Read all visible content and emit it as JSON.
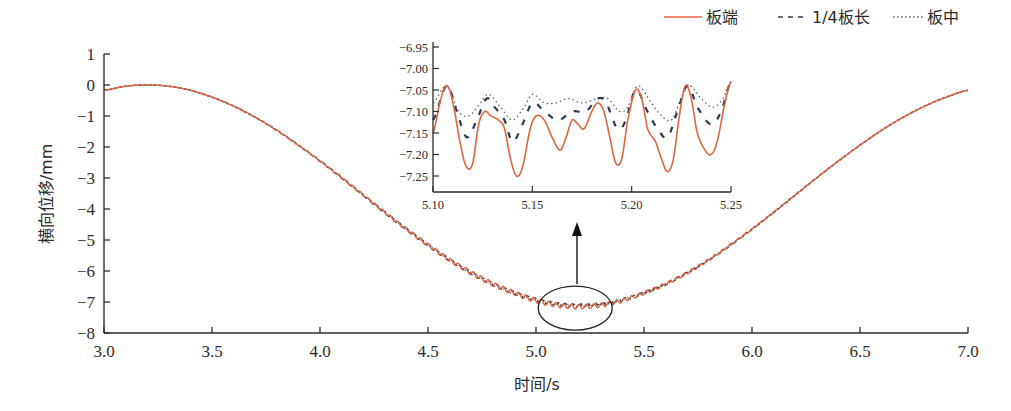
{
  "chart_data": {
    "type": "line",
    "title": "",
    "xlabel": "时间/s",
    "ylabel": "横向位移/mm",
    "xlim": [
      3.0,
      7.0
    ],
    "ylim": [
      -8,
      1
    ],
    "xticks": [
      "3.0",
      "3.5",
      "4.0",
      "4.5",
      "5.0",
      "5.5",
      "6.0",
      "6.5",
      "7.0"
    ],
    "yticks": [
      "1",
      "0",
      "−1",
      "−2",
      "−3",
      "−4",
      "−5",
      "−6",
      "−7",
      "−8"
    ],
    "grid": false,
    "legend_position": "top-right",
    "colors": {
      "板端": "#e0653f",
      "1/4板长": "#2b3a4f",
      "板中": "#5a6472",
      "axis": "#2a2a2a"
    },
    "x": [
      3.0,
      3.1,
      3.2,
      3.3,
      3.4,
      3.5,
      3.6,
      3.7,
      3.8,
      3.9,
      4.0,
      4.1,
      4.2,
      4.3,
      4.4,
      4.5,
      4.6,
      4.7,
      4.8,
      4.9,
      5.0,
      5.1,
      5.2,
      5.3,
      5.4,
      5.5,
      5.6,
      5.7,
      5.8,
      5.9,
      6.0,
      6.1,
      6.2,
      6.3,
      6.4,
      6.5,
      6.6,
      6.7,
      6.8,
      6.9,
      7.0
    ],
    "series": [
      {
        "name": "板端",
        "style": "solid",
        "values": [
          -0.17,
          -0.04,
          0.0,
          -0.04,
          -0.17,
          -0.39,
          -0.68,
          -1.04,
          -1.46,
          -1.94,
          -2.45,
          -2.99,
          -3.55,
          -4.11,
          -4.65,
          -5.16,
          -5.64,
          -6.06,
          -6.42,
          -6.71,
          -6.95,
          -7.1,
          -7.15,
          -7.1,
          -6.95,
          -6.71,
          -6.42,
          -6.06,
          -5.64,
          -5.16,
          -4.65,
          -4.11,
          -3.55,
          -2.99,
          -2.45,
          -1.94,
          -1.46,
          -1.04,
          -0.68,
          -0.39,
          -0.17
        ]
      },
      {
        "name": "1/4板长",
        "style": "dashed",
        "values": [
          -0.17,
          -0.04,
          0.0,
          -0.04,
          -0.17,
          -0.39,
          -0.68,
          -1.04,
          -1.46,
          -1.94,
          -2.45,
          -2.99,
          -3.55,
          -4.11,
          -4.65,
          -5.16,
          -5.64,
          -6.06,
          -6.42,
          -6.71,
          -6.93,
          -7.07,
          -7.11,
          -7.07,
          -6.93,
          -6.71,
          -6.42,
          -6.06,
          -5.64,
          -5.16,
          -4.65,
          -4.11,
          -3.55,
          -2.99,
          -2.45,
          -1.94,
          -1.46,
          -1.04,
          -0.68,
          -0.39,
          -0.17
        ]
      },
      {
        "name": "板中",
        "style": "dotted",
        "values": [
          -0.17,
          -0.04,
          0.0,
          -0.04,
          -0.17,
          -0.39,
          -0.68,
          -1.04,
          -1.46,
          -1.94,
          -2.45,
          -2.99,
          -3.55,
          -4.11,
          -4.65,
          -5.16,
          -5.64,
          -6.06,
          -6.42,
          -6.71,
          -6.92,
          -7.06,
          -7.09,
          -7.06,
          -6.92,
          -6.71,
          -6.42,
          -6.06,
          -5.64,
          -5.16,
          -4.65,
          -4.11,
          -3.55,
          -2.99,
          -2.45,
          -1.94,
          -1.46,
          -1.04,
          -0.68,
          -0.39,
          -0.17
        ]
      }
    ],
    "annotations": [
      {
        "type": "ellipse",
        "center": [
          5.2,
          -7.1
        ],
        "note": "zoom region"
      },
      {
        "type": "arrow",
        "from": "ellipse",
        "to": "inset"
      }
    ],
    "inset": {
      "type": "line",
      "xlim": [
        5.1,
        5.25
      ],
      "ylim": [
        -7.285,
        -6.95
      ],
      "xticks": [
        "5.10",
        "5.15",
        "5.20",
        "5.25"
      ],
      "yticks": [
        "−6.95",
        "−7.00",
        "−7.05",
        "−7.10",
        "−7.15",
        "−7.20",
        "−7.25"
      ],
      "series": [
        {
          "name": "板端",
          "style": "solid",
          "x": [
            5.1,
            5.104,
            5.107,
            5.11,
            5.114,
            5.117,
            5.12,
            5.123,
            5.126,
            5.129,
            5.133,
            5.136,
            5.139,
            5.142,
            5.145,
            5.149,
            5.152,
            5.156,
            5.16,
            5.164,
            5.167,
            5.17,
            5.173,
            5.176,
            5.18,
            5.183,
            5.186,
            5.189,
            5.192,
            5.195,
            5.198,
            5.202,
            5.205,
            5.208,
            5.212,
            5.215,
            5.218,
            5.221,
            5.224,
            5.227,
            5.23,
            5.233,
            5.237,
            5.24,
            5.243,
            5.247,
            5.25
          ],
          "values": [
            -7.15,
            -7.07,
            -7.04,
            -7.08,
            -7.18,
            -7.23,
            -7.22,
            -7.13,
            -7.1,
            -7.11,
            -7.12,
            -7.14,
            -7.21,
            -7.25,
            -7.23,
            -7.14,
            -7.11,
            -7.12,
            -7.16,
            -7.19,
            -7.16,
            -7.12,
            -7.13,
            -7.14,
            -7.1,
            -7.08,
            -7.1,
            -7.16,
            -7.22,
            -7.21,
            -7.12,
            -7.05,
            -7.07,
            -7.14,
            -7.17,
            -7.21,
            -7.24,
            -7.21,
            -7.11,
            -7.04,
            -7.07,
            -7.15,
            -7.19,
            -7.2,
            -7.17,
            -7.08,
            -7.03
          ]
        },
        {
          "name": "1/4板长",
          "style": "dashed",
          "x": [
            5.1,
            5.107,
            5.112,
            5.117,
            5.122,
            5.127,
            5.131,
            5.136,
            5.14,
            5.145,
            5.15,
            5.156,
            5.163,
            5.17,
            5.177,
            5.183,
            5.187,
            5.193,
            5.197,
            5.202,
            5.208,
            5.213,
            5.218,
            5.223,
            5.228,
            5.233,
            5.24,
            5.245,
            5.25
          ],
          "values": [
            -7.12,
            -7.04,
            -7.1,
            -7.16,
            -7.12,
            -7.07,
            -7.09,
            -7.12,
            -7.17,
            -7.13,
            -7.08,
            -7.1,
            -7.12,
            -7.1,
            -7.1,
            -7.07,
            -7.08,
            -7.14,
            -7.12,
            -7.05,
            -7.1,
            -7.14,
            -7.16,
            -7.1,
            -7.04,
            -7.09,
            -7.13,
            -7.1,
            -7.03
          ]
        },
        {
          "name": "板中",
          "style": "dotted",
          "x": [
            5.1,
            5.107,
            5.113,
            5.118,
            5.124,
            5.128,
            5.134,
            5.14,
            5.146,
            5.15,
            5.156,
            5.162,
            5.168,
            5.175,
            5.183,
            5.188,
            5.194,
            5.198,
            5.203,
            5.21,
            5.215,
            5.22,
            5.225,
            5.229,
            5.235,
            5.241,
            5.246,
            5.25
          ],
          "values": [
            -7.08,
            -7.04,
            -7.1,
            -7.11,
            -7.08,
            -7.06,
            -7.09,
            -7.12,
            -7.09,
            -7.06,
            -7.08,
            -7.08,
            -7.07,
            -7.08,
            -7.07,
            -7.07,
            -7.1,
            -7.09,
            -7.04,
            -7.08,
            -7.11,
            -7.12,
            -7.07,
            -7.04,
            -7.07,
            -7.09,
            -7.07,
            -7.03
          ]
        }
      ]
    }
  },
  "legend": {
    "items": [
      {
        "label": "板端",
        "style": "solid"
      },
      {
        "label": "1/4板长",
        "style": "dashed"
      },
      {
        "label": "板中",
        "style": "dotted"
      }
    ]
  }
}
